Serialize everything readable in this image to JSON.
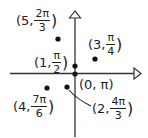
{
  "diagram": {
    "type": "polar-points",
    "axes": {
      "horizontal_arrow": "right",
      "vertical_arrow": "up",
      "color": "#333333"
    },
    "points": [
      {
        "r": "5",
        "theta_num": "2π",
        "theta_den": "3",
        "x": 58,
        "y": 39
      },
      {
        "r": "3",
        "theta_num": "π",
        "theta_den": "4",
        "x": 95,
        "y": 59
      },
      {
        "r": "1",
        "theta_num": "π",
        "theta_den": "2",
        "x": 75,
        "y": 66
      },
      {
        "r": "0",
        "theta": "π",
        "x": 75,
        "y": 74
      },
      {
        "r": "4",
        "theta_num": "7π",
        "theta_den": "6",
        "x": 47,
        "y": 88
      },
      {
        "r": "2",
        "theta_num": "4π",
        "theta_den": "3",
        "x": 67,
        "y": 87
      }
    ],
    "labels": {
      "p5_r": "(5,",
      "p5_num": "2π",
      "p5_den": "3",
      "p5_close": ")",
      "p3_r": "(3,",
      "p3_num": "π",
      "p3_den": "4",
      "p3_close": ")",
      "p1_r": "(1,",
      "p1_num": "π",
      "p1_den": "2",
      "p1_close": ")",
      "p0": "(0, π)",
      "p4_r": "(4,",
      "p4_num": "7π",
      "p4_den": "6",
      "p4_close": ")",
      "p2_r": "(2,",
      "p2_num": "4π",
      "p2_den": "3",
      "p2_close": ")"
    }
  }
}
